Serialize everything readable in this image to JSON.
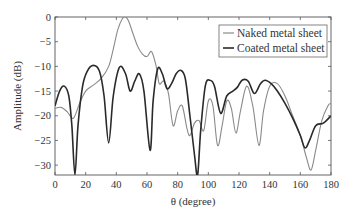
{
  "chart_data": {
    "type": "line",
    "title": "",
    "xlabel": "θ (degree)",
    "ylabel": "Amplitude (dB)",
    "xlim": [
      0,
      180
    ],
    "ylim": [
      -32,
      0
    ],
    "xticks": [
      0,
      20,
      40,
      60,
      80,
      100,
      120,
      140,
      160,
      180
    ],
    "yticks": [
      0,
      -5,
      -10,
      -15,
      -20,
      -25,
      -30
    ],
    "xtick_labels": [
      "0",
      "20",
      "40",
      "60",
      "80",
      "100",
      "120",
      "140",
      "160",
      "180"
    ],
    "ytick_labels": [
      "0",
      "−5",
      "−10",
      "−15",
      "−20",
      "−25",
      "−30"
    ],
    "grid": false,
    "legend_position": "upper right",
    "series": [
      {
        "name": "Naked metal sheet",
        "color": "#8a8a8a",
        "x": [
          0,
          4,
          8,
          12,
          16,
          20,
          25,
          30,
          35,
          38,
          41,
          44,
          46,
          48,
          51,
          54,
          57,
          60,
          63,
          66,
          68,
          71,
          74,
          77,
          80,
          83,
          86,
          88,
          91,
          94,
          97,
          100,
          103,
          106,
          109,
          112,
          115,
          118,
          121,
          125,
          129,
          133,
          136,
          140,
          145,
          150,
          155,
          160,
          164,
          167,
          170,
          174,
          178,
          180
        ],
        "y": [
          -18.5,
          -18.3,
          -19.2,
          -20.5,
          -17.5,
          -15,
          -13.8,
          -12.5,
          -10,
          -6.5,
          -2.5,
          -0.3,
          0,
          -0.8,
          -3.5,
          -6,
          -7.5,
          -8,
          -7,
          -10,
          -13.5,
          -13,
          -15.5,
          -22,
          -19,
          -18,
          -22.5,
          -24,
          -21.5,
          -21,
          -23,
          -17,
          -18,
          -26,
          -22,
          -17,
          -18.5,
          -23.5,
          -19,
          -14,
          -18,
          -26,
          -19,
          -14,
          -13.5,
          -16,
          -20,
          -24,
          -28.5,
          -31,
          -27,
          -21,
          -18,
          -17.5
        ]
      },
      {
        "name": "Coated metal sheet",
        "color": "#2a2a2a",
        "x": [
          0,
          3,
          6,
          9,
          11,
          13,
          15,
          18,
          21,
          25,
          29,
          32,
          35,
          38,
          42,
          46,
          49,
          52,
          55,
          58,
          62,
          64,
          67,
          70,
          73,
          76,
          79,
          82,
          85,
          88,
          91,
          93,
          95,
          98,
          101,
          104,
          108,
          112,
          116,
          119,
          122,
          126,
          130,
          134,
          137,
          141,
          145,
          150,
          155,
          160,
          163,
          166,
          170,
          175,
          180
        ],
        "y": [
          -18,
          -15,
          -14,
          -16,
          -22,
          -32,
          -22,
          -14,
          -11,
          -9.8,
          -11,
          -16,
          -25.5,
          -16,
          -10.2,
          -11.5,
          -15,
          -13,
          -11.5,
          -15,
          -27,
          -17,
          -10.5,
          -11.5,
          -14.5,
          -13.5,
          -11.5,
          -10.8,
          -12.5,
          -20,
          -28,
          -32,
          -23,
          -14,
          -12.8,
          -14,
          -19.5,
          -16,
          -15,
          -14.2,
          -12.8,
          -13,
          -15.5,
          -13.5,
          -12.8,
          -13.5,
          -15,
          -17.5,
          -20.5,
          -24,
          -26.5,
          -25,
          -22,
          -21.5,
          -20
        ]
      }
    ]
  }
}
